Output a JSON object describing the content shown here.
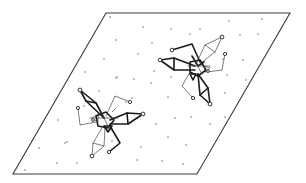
{
  "figure": {
    "colors": {
      "plane_stroke": "#3a3a3a",
      "bond_bold": "#1a1a1a",
      "bond_thin": "#444444",
      "lattice_dot": "#555555",
      "background": "#ffffff"
    },
    "plane": {
      "corners": [
        [
          106,
          13
        ],
        [
          290,
          13
        ],
        [
          197,
          174
        ],
        [
          13,
          174
        ]
      ]
    },
    "lattice_points": [
      [
        110,
        17
      ],
      [
        143,
        27
      ],
      [
        171,
        29
      ],
      [
        200,
        29
      ],
      [
        229,
        21
      ],
      [
        262,
        19
      ],
      [
        116,
        40
      ],
      [
        152,
        43
      ],
      [
        190,
        34
      ],
      [
        240,
        35
      ],
      [
        258,
        34
      ],
      [
        104,
        59
      ],
      [
        138,
        54
      ],
      [
        223,
        59
      ],
      [
        243,
        60
      ],
      [
        85,
        72
      ],
      [
        117,
        77
      ],
      [
        154,
        71
      ],
      [
        227,
        75
      ],
      [
        246,
        80
      ],
      [
        116,
        78
      ],
      [
        134,
        79
      ],
      [
        151,
        83
      ],
      [
        171,
        77
      ],
      [
        99,
        91
      ],
      [
        132,
        98
      ],
      [
        168,
        97
      ],
      [
        225,
        93
      ],
      [
        58,
        120
      ],
      [
        84,
        106
      ],
      [
        126,
        102
      ],
      [
        175,
        118
      ],
      [
        191,
        117
      ],
      [
        39,
        148
      ],
      [
        65,
        143
      ],
      [
        156,
        124
      ],
      [
        210,
        124
      ],
      [
        225,
        117
      ],
      [
        67,
        142
      ],
      [
        112,
        141
      ],
      [
        141,
        147
      ],
      [
        168,
        137
      ],
      [
        186,
        145
      ],
      [
        25,
        170
      ],
      [
        57,
        163
      ],
      [
        77,
        163
      ],
      [
        137,
        160
      ],
      [
        162,
        161
      ],
      [
        183,
        164
      ]
    ]
  }
}
